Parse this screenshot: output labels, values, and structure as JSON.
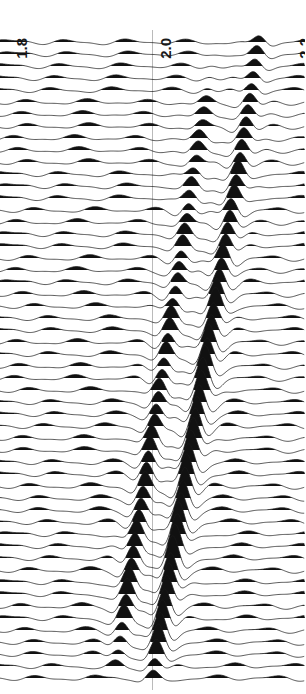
{
  "figure": {
    "type": "seismic-wiggle-gather",
    "background_color": "#ffffff",
    "trace_color": "#111111",
    "gridline_color": "#8a8a8a"
  },
  "axis": {
    "orientation": "horizontal-top",
    "rotated_labels": true,
    "ticks": [
      {
        "label": "1.8",
        "value": 1.8,
        "x_px": 14
      },
      {
        "label": "2.0",
        "value": 2.0,
        "x_px": 158
      },
      {
        "label": "2.2",
        "value": 2.2,
        "x_px": 297
      }
    ],
    "range": [
      1.78,
      2.22
    ],
    "gridlines_at": [
      2.0
    ]
  },
  "chart_data": {
    "type": "line",
    "title": "",
    "xlabel": "",
    "ylabel": "",
    "xlim": [
      1.78,
      2.22
    ],
    "grid": true,
    "legend": "none",
    "trace_count": 54,
    "trace_spacing_px": 12,
    "first_trace_y_px": 42,
    "tick_values": [
      1.8,
      2.0,
      2.2
    ],
    "tick_labels": [
      "1.8",
      "2.0",
      "2.2"
    ],
    "series": [
      {
        "name": "main-moveout-event",
        "x_start": 2.155,
        "x_end": 2.0,
        "amplitude": 1.0,
        "comment": "apex converges to the 2.0 gridline at the last trace"
      },
      {
        "name": "secondary-limb-event",
        "x_start": 2.09,
        "x_end": 1.945,
        "amplitude": 0.8,
        "comment": "parallel limb offset ~-0.055 from main event"
      },
      {
        "name": "background-noise",
        "period": 0.085,
        "amplitude": 0.3,
        "comment": "quasi-periodic low amplitude wavelets on every trace"
      }
    ]
  }
}
